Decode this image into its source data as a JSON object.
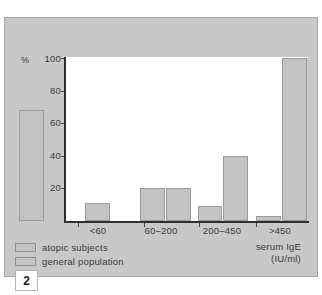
{
  "figure": {
    "number": "2"
  },
  "chart_data": {
    "type": "bar",
    "title": "",
    "xlabel": "serum IgE",
    "xlabel_unit": "(IU/ml)",
    "ylabel": "%",
    "ylim": [
      0,
      100
    ],
    "yticks": [
      100,
      80,
      60,
      40,
      20
    ],
    "grid": false,
    "legend_position": "bottom-left",
    "categories": [
      "<60",
      "60–200",
      "200–450",
      ">450"
    ],
    "series": [
      {
        "name": "atopic subjects",
        "values": [
          68,
          20,
          9,
          3
        ]
      },
      {
        "name": "general population",
        "values": [
          11,
          20,
          40,
          100
        ]
      }
    ]
  },
  "colors": {
    "panel_background": "#c8c8c8",
    "plot_background": "#ffffff",
    "bar_fill": "#c3c3c3",
    "bar_stroke": "#9b9b9b",
    "axis": "#2e2e2e",
    "text": "#39393a"
  }
}
